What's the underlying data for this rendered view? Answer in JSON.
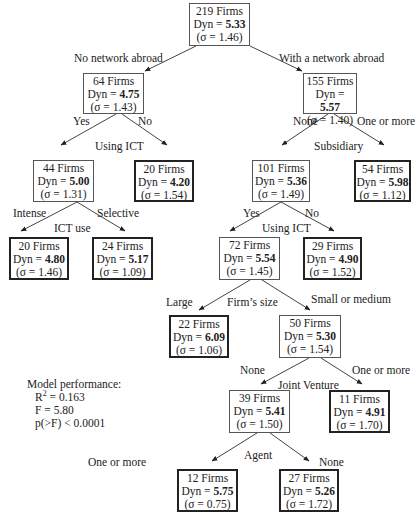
{
  "chart_data": {
    "type": "decision_tree",
    "title": "",
    "nodes": [
      {
        "id": "n219",
        "firms": "219 Firms",
        "dyn": "5.33",
        "sigma": "1.46",
        "leaf": false,
        "x": 189,
        "y": 3,
        "w": 61,
        "h": 43
      },
      {
        "id": "n64",
        "firms": "64 Firms",
        "dyn": "4.75",
        "sigma": "1.43",
        "leaf": false,
        "x": 83,
        "y": 73,
        "w": 61,
        "h": 41
      },
      {
        "id": "n155",
        "firms": "155 Firms",
        "dyn": "5.57",
        "sigma": "1.40",
        "leaf": false,
        "x": 303,
        "y": 73,
        "w": 54,
        "h": 41
      },
      {
        "id": "n44",
        "firms": "44 Firms",
        "dyn": "5.00",
        "sigma": "1.31",
        "leaf": false,
        "x": 33,
        "y": 160,
        "w": 61,
        "h": 42
      },
      {
        "id": "n20a",
        "firms": "20 Firms",
        "dyn": "4.20",
        "sigma": "1.54",
        "leaf": true,
        "x": 134,
        "y": 160,
        "w": 60,
        "h": 42
      },
      {
        "id": "n101",
        "firms": "101 Firms",
        "dyn": "5.36",
        "sigma": "1.49",
        "leaf": false,
        "x": 252,
        "y": 160,
        "w": 58,
        "h": 42
      },
      {
        "id": "n54",
        "firms": "54 Firms",
        "dyn": "5.98",
        "sigma": "1.12",
        "leaf": true,
        "x": 354,
        "y": 160,
        "w": 57,
        "h": 42
      },
      {
        "id": "n20b",
        "firms": "20 Firms",
        "dyn": "4.80",
        "sigma": "1.46",
        "leaf": true,
        "x": 9,
        "y": 237,
        "w": 60,
        "h": 43
      },
      {
        "id": "n24",
        "firms": "24 Firms",
        "dyn": "5.17",
        "sigma": "1.09",
        "leaf": true,
        "x": 92,
        "y": 237,
        "w": 61,
        "h": 43
      },
      {
        "id": "n72",
        "firms": "72 Firms",
        "dyn": "5.54",
        "sigma": "1.45",
        "leaf": false,
        "x": 219,
        "y": 237,
        "w": 61,
        "h": 43
      },
      {
        "id": "n29",
        "firms": "29 Firms",
        "dyn": "4.90",
        "sigma": "1.52",
        "leaf": true,
        "x": 303,
        "y": 237,
        "w": 59,
        "h": 43
      },
      {
        "id": "n22",
        "firms": "22 Firms",
        "dyn": "6.09",
        "sigma": "1.06",
        "leaf": true,
        "x": 169,
        "y": 315,
        "w": 60,
        "h": 43
      },
      {
        "id": "n50",
        "firms": "50 Firms",
        "dyn": "5.30",
        "sigma": "1.54",
        "leaf": false,
        "x": 279,
        "y": 315,
        "w": 62,
        "h": 43
      },
      {
        "id": "n39",
        "firms": "39 Firms",
        "dyn": "5.41",
        "sigma": "1.50",
        "leaf": false,
        "x": 229,
        "y": 390,
        "w": 61,
        "h": 43
      },
      {
        "id": "n11",
        "firms": "11 Firms",
        "dyn": "4.91",
        "sigma": "1.70",
        "leaf": true,
        "x": 329,
        "y": 390,
        "w": 61,
        "h": 43
      },
      {
        "id": "n12",
        "firms": "12 Firms",
        "dyn": "5.75",
        "sigma": "0.75",
        "leaf": true,
        "x": 177,
        "y": 469,
        "w": 61,
        "h": 43
      },
      {
        "id": "n27",
        "firms": "27 Firms",
        "dyn": "5.26",
        "sigma": "1.72",
        "leaf": true,
        "x": 279,
        "y": 469,
        "w": 60,
        "h": 43
      }
    ],
    "edges": [
      {
        "from": [
          196,
          46
        ],
        "to": [
          145,
          71
        ]
      },
      {
        "from": [
          250,
          46
        ],
        "to": [
          302,
          71
        ]
      },
      {
        "from": [
          116,
          114
        ],
        "to": [
          61,
          145
        ]
      },
      {
        "from": [
          122,
          114
        ],
        "to": [
          167,
          145
        ]
      },
      {
        "from": [
          328,
          114
        ],
        "to": [
          282,
          145
        ]
      },
      {
        "from": [
          334,
          114
        ],
        "to": [
          384,
          145
        ]
      },
      {
        "from": [
          77,
          202
        ],
        "to": [
          21,
          231
        ]
      },
      {
        "from": [
          77,
          202
        ],
        "to": [
          125,
          231
        ]
      },
      {
        "from": [
          281,
          202
        ],
        "to": [
          230,
          231
        ]
      },
      {
        "from": [
          281,
          202
        ],
        "to": [
          334,
          231
        ]
      },
      {
        "from": [
          250,
          280
        ],
        "to": [
          199,
          310
        ]
      },
      {
        "from": [
          262,
          280
        ],
        "to": [
          310,
          310
        ]
      },
      {
        "from": [
          309,
          358
        ],
        "to": [
          261,
          384
        ]
      },
      {
        "from": [
          321,
          358
        ],
        "to": [
          362,
          384
        ]
      },
      {
        "from": [
          257,
          433
        ],
        "to": [
          212,
          461
        ]
      },
      {
        "from": [
          270,
          433
        ],
        "to": [
          309,
          461
        ]
      }
    ],
    "splits": [
      {
        "text": "No network abroad",
        "x": 74,
        "y": 52
      },
      {
        "text": "With a network abroad",
        "x": 279,
        "y": 52
      },
      {
        "text": "Yes",
        "x": 73,
        "y": 115
      },
      {
        "text": "No",
        "x": 138,
        "y": 115
      },
      {
        "text": "Using ICT",
        "x": 95,
        "y": 140
      },
      {
        "text": "None",
        "x": 293,
        "y": 115
      },
      {
        "text": "One or more",
        "x": 357,
        "y": 115
      },
      {
        "text": "Subsidiary",
        "x": 314,
        "y": 140
      },
      {
        "text": "Intense",
        "x": 13,
        "y": 207
      },
      {
        "text": "Selective",
        "x": 97,
        "y": 207
      },
      {
        "text": "ICT use",
        "x": 54,
        "y": 222
      },
      {
        "text": "Yes",
        "x": 243,
        "y": 207
      },
      {
        "text": "No",
        "x": 305,
        "y": 207
      },
      {
        "text": "Using ICT",
        "x": 262,
        "y": 222
      },
      {
        "text": "Large",
        "x": 166,
        "y": 296
      },
      {
        "text": "Firm’s size",
        "x": 227,
        "y": 296
      },
      {
        "text": "Small or medium",
        "x": 311,
        "y": 293
      },
      {
        "text": "None",
        "x": 240,
        "y": 364
      },
      {
        "text": "One or more",
        "x": 352,
        "y": 364
      },
      {
        "text": "Joint Venture",
        "x": 278,
        "y": 379
      },
      {
        "text": "One or more",
        "x": 88,
        "y": 456
      },
      {
        "text": "Agent",
        "x": 244,
        "y": 449
      },
      {
        "text": "None",
        "x": 319,
        "y": 456
      }
    ],
    "model_performance": {
      "heading": "Model performance:",
      "r2_label": "R",
      "r2_sup": "2",
      "r2_value": " = 0.163",
      "f": "F = 5.80",
      "p": "p(>F) < 0.0001"
    }
  }
}
